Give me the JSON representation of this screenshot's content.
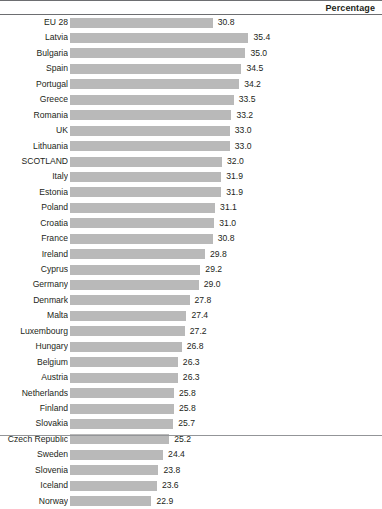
{
  "header": {
    "title": "Percentage"
  },
  "chart_data": {
    "type": "bar",
    "orientation": "horizontal",
    "title": "",
    "subtitle": "",
    "xlabel": "Percentage",
    "ylabel": "",
    "grid": false,
    "legend": null,
    "value_labels": true,
    "xlim": [
      0,
      35.4
    ],
    "highlighted_category": "SCOTLAND",
    "categories": [
      "EU 28",
      "Latvia",
      "Bulgaria",
      "Spain",
      "Portugal",
      "Greece",
      "Romania",
      "UK",
      "Lithuania",
      "SCOTLAND",
      "Italy",
      "Estonia",
      "Poland",
      "Croatia",
      "France",
      "Ireland",
      "Cyprus",
      "Germany",
      "Denmark",
      "Malta",
      "Luxembourg",
      "Hungary",
      "Belgium",
      "Austria",
      "Netherlands",
      "Finland",
      "Slovakia",
      "Czech Republic",
      "Sweden",
      "Slovenia",
      "Iceland",
      "Norway"
    ],
    "values": [
      30.8,
      35.4,
      35.0,
      34.5,
      34.2,
      33.5,
      33.2,
      33.0,
      33.0,
      32.0,
      31.9,
      31.9,
      31.1,
      31.0,
      30.8,
      29.8,
      29.2,
      29.0,
      27.8,
      27.4,
      27.2,
      26.8,
      26.3,
      26.3,
      25.8,
      25.8,
      25.7,
      25.2,
      24.4,
      23.8,
      23.6,
      22.9
    ],
    "value_label_strings": [
      "30.8",
      "35.4",
      "35.0",
      "34.5",
      "34.2",
      "33.5",
      "33.2",
      "33.0",
      "33.0",
      "32.0",
      "31.9",
      "31.9",
      "31.1",
      "31.0",
      "30.8",
      "29.8",
      "29.2",
      "29.0",
      "27.8",
      "27.4",
      "27.2",
      "26.8",
      "26.3",
      "26.3",
      "25.8",
      "25.8",
      "25.7",
      "25.2",
      "24.4",
      "23.8",
      "23.6",
      "22.9"
    ],
    "bar_color": "#b9b9b9",
    "text_color": "#231f20",
    "rule_color": "#6d6e71"
  }
}
